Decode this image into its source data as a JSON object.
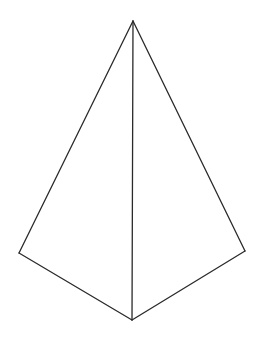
{
  "figure": {
    "stroke_color": "#2a2a2a",
    "background_color": "#ffffff",
    "vertices": [
      "apex",
      "left",
      "right",
      "bottom"
    ],
    "edges": [
      [
        "apex",
        "left"
      ],
      [
        "apex",
        "right"
      ],
      [
        "apex",
        "bottom"
      ],
      [
        "left",
        "bottom"
      ],
      [
        "right",
        "bottom"
      ]
    ]
  }
}
